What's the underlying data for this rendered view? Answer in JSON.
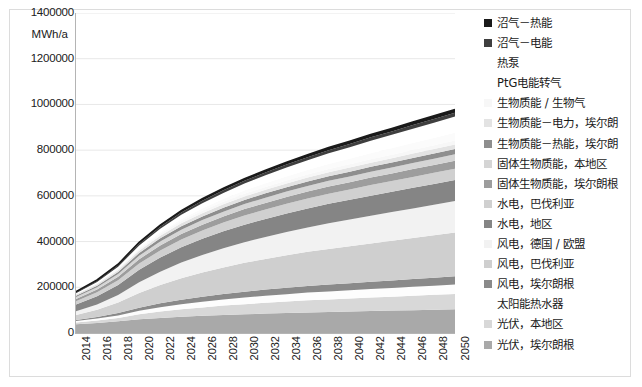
{
  "axis": {
    "y_unit": "MWh/a",
    "y_ticks": [
      "1400000",
      "1200000",
      "1000000",
      "800000",
      "600000",
      "400000",
      "200000",
      "0"
    ],
    "x_ticks": [
      "2014",
      "2016",
      "2018",
      "2020",
      "2022",
      "2024",
      "2026",
      "2028",
      "2030",
      "2032",
      "2034",
      "2036",
      "2038",
      "2040",
      "2042",
      "2044",
      "2046",
      "2048",
      "2050"
    ]
  },
  "legend": {
    "items": [
      {
        "label": "沼气－热能",
        "color": "#1a1a1a"
      },
      {
        "label": "沼气－电能",
        "color": "#3f3f3f"
      },
      {
        "label": "热泵",
        "color": "#ffffff"
      },
      {
        "label": "PtG电能转气",
        "color": "#fbfbfb"
      },
      {
        "label": "生物质能 / 生物气",
        "color": "#f7f7f7"
      },
      {
        "label": "生物质能－电力，埃尔朗",
        "color": "#e3e3e3"
      },
      {
        "label": "生物质能－热能，埃尔朗",
        "color": "#8e8e8e"
      },
      {
        "label": "固体生物质能，本地区",
        "color": "#d5d5d5"
      },
      {
        "label": "固体生物质能，埃尔朗根",
        "color": "#9d9d9d"
      },
      {
        "label": "水电，巴伐利亚",
        "color": "#d0d0d0"
      },
      {
        "label": "水电，地区",
        "color": "#858585"
      },
      {
        "label": "风电，德国 / 欧盟",
        "color": "#f2f2f2"
      },
      {
        "label": "风电，巴伐利亚",
        "color": "#cfcfcf"
      },
      {
        "label": "风电，埃尔朗根",
        "color": "#8a8a8a"
      },
      {
        "label": "太阳能热水器",
        "color": "#fdfdfd"
      },
      {
        "label": "光伏，本地区",
        "color": "#d8d8d8"
      },
      {
        "label": "光伏，埃尔朗根",
        "color": "#a9a9a9"
      }
    ]
  },
  "chart_data": {
    "type": "area",
    "title": "",
    "xlabel": "",
    "ylabel": "MWh/a",
    "ylim": [
      0,
      1400000
    ],
    "xlim": [
      2014,
      2050
    ],
    "grid": true,
    "stacked": true,
    "legend_position": "right",
    "x": [
      2014,
      2016,
      2018,
      2020,
      2022,
      2024,
      2026,
      2028,
      2030,
      2032,
      2034,
      2036,
      2038,
      2040,
      2042,
      2044,
      2046,
      2048,
      2050
    ],
    "series": [
      {
        "name": "光伏，埃尔朗根",
        "color": "#a9a9a9",
        "values": [
          38000,
          44000,
          51000,
          60000,
          66000,
          71000,
          75000,
          79000,
          82000,
          85000,
          88000,
          90000,
          92000,
          94000,
          96000,
          98000,
          100000,
          102000,
          104000
        ]
      },
      {
        "name": "光伏，本地区",
        "color": "#d8d8d8",
        "values": [
          8000,
          11000,
          15000,
          22000,
          28000,
          33000,
          37000,
          41000,
          44000,
          47000,
          50000,
          53000,
          55000,
          57000,
          59000,
          61000,
          63000,
          65000,
          67000
        ]
      },
      {
        "name": "太阳能热水器",
        "color": "#fdfdfd",
        "values": [
          6000,
          8000,
          11000,
          15000,
          19000,
          22000,
          25000,
          27000,
          29000,
          31000,
          32000,
          34000,
          35000,
          36000,
          37000,
          38000,
          39000,
          40000,
          41000
        ]
      },
      {
        "name": "风电，埃尔朗根",
        "color": "#8a8a8a",
        "values": [
          5000,
          7000,
          10000,
          14000,
          17000,
          20000,
          22000,
          24000,
          26000,
          27000,
          28000,
          29000,
          30000,
          31000,
          32000,
          33000,
          34000,
          35000,
          36000
        ]
      },
      {
        "name": "风电，巴伐利亚",
        "color": "#cfcfcf",
        "values": [
          22000,
          32000,
          46000,
          64000,
          80000,
          94000,
          106000,
          116000,
          126000,
          134000,
          142000,
          149000,
          156000,
          162000,
          168000,
          174000,
          180000,
          186000,
          192000
        ]
      },
      {
        "name": "风电，德国 / 欧盟",
        "color": "#f2f2f2",
        "values": [
          16000,
          23000,
          33000,
          47000,
          58000,
          68000,
          76000,
          84000,
          90000,
          96000,
          102000,
          107000,
          112000,
          117000,
          121000,
          125000,
          129000,
          133000,
          137000
        ]
      },
      {
        "name": "水电，地区",
        "color": "#858585",
        "values": [
          30000,
          36000,
          44000,
          55000,
          62000,
          67000,
          71000,
          74000,
          77000,
          79000,
          81000,
          83000,
          85000,
          86000,
          88000,
          89000,
          90000,
          91000,
          92000
        ]
      },
      {
        "name": "水电，巴伐利亚",
        "color": "#d0d0d0",
        "values": [
          14000,
          17000,
          21000,
          27000,
          31000,
          34000,
          36000,
          38000,
          40000,
          41000,
          42000,
          43000,
          44000,
          45000,
          46000,
          47000,
          48000,
          49000,
          50000
        ]
      },
      {
        "name": "固体生物质能，埃尔朗根",
        "color": "#9d9d9d",
        "values": [
          10000,
          12000,
          15000,
          19000,
          22000,
          24000,
          26000,
          27000,
          28000,
          29000,
          30000,
          31000,
          32000,
          32000,
          33000,
          33000,
          34000,
          34000,
          35000
        ]
      },
      {
        "name": "固体生物质能，本地区",
        "color": "#d5d5d5",
        "values": [
          8000,
          10000,
          12000,
          15000,
          17000,
          19000,
          20000,
          21000,
          22000,
          23000,
          24000,
          24000,
          25000,
          25000,
          26000,
          26000,
          27000,
          27000,
          28000
        ]
      },
      {
        "name": "生物质能－热能，埃尔朗",
        "color": "#8e8e8e",
        "values": [
          6000,
          7000,
          9000,
          12000,
          14000,
          15000,
          16000,
          17000,
          18000,
          19000,
          19000,
          20000,
          20000,
          21000,
          21000,
          22000,
          22000,
          23000,
          23000
        ]
      },
      {
        "name": "生物质能－电力，埃尔朗",
        "color": "#e3e3e3",
        "values": [
          5000,
          6000,
          8000,
          10000,
          12000,
          13000,
          14000,
          15000,
          15000,
          16000,
          16000,
          17000,
          17000,
          18000,
          18000,
          19000,
          19000,
          20000,
          20000
        ]
      },
      {
        "name": "生物质能 / 生物气",
        "color": "#f7f7f7",
        "values": [
          4000,
          5000,
          6000,
          8000,
          9000,
          10000,
          11000,
          11000,
          12000,
          12000,
          13000,
          13000,
          14000,
          14000,
          15000,
          15000,
          16000,
          16000,
          17000
        ]
      },
      {
        "name": "PtG电能转气",
        "color": "#fbfbfb",
        "values": [
          0,
          1000,
          2000,
          4000,
          6000,
          8000,
          10000,
          12000,
          14000,
          16000,
          18000,
          20000,
          22000,
          24000,
          26000,
          28000,
          30000,
          32000,
          34000
        ]
      },
      {
        "name": "热泵",
        "color": "#ffffff",
        "values": [
          2000,
          4000,
          7000,
          11000,
          15000,
          19000,
          23000,
          27000,
          31000,
          35000,
          39000,
          43000,
          47000,
          51000,
          55000,
          59000,
          63000,
          67000,
          71000
        ]
      },
      {
        "name": "沼气－电能",
        "color": "#3f3f3f",
        "values": [
          4000,
          5000,
          6000,
          8000,
          9000,
          10000,
          11000,
          11000,
          12000,
          12000,
          13000,
          13000,
          14000,
          14000,
          15000,
          15000,
          16000,
          16000,
          17000
        ]
      },
      {
        "name": "沼气－热能",
        "color": "#1a1a1a",
        "values": [
          3000,
          4000,
          5000,
          6000,
          7000,
          8000,
          8000,
          9000,
          9000,
          10000,
          10000,
          11000,
          11000,
          12000,
          12000,
          13000,
          13000,
          14000,
          14000
        ]
      }
    ]
  }
}
